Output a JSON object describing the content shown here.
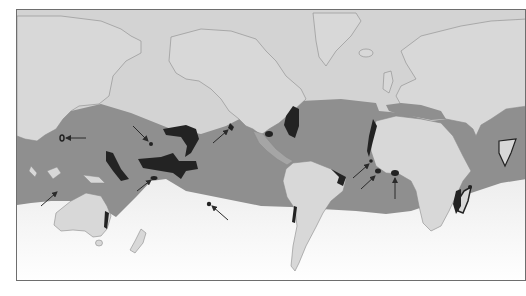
{
  "map": {
    "type": "world-distribution-map",
    "projection": "mercator-pacific-centered",
    "colors": {
      "background": "#ffffff",
      "frame_border": "#6e6e6e",
      "land": "#d6d6d6",
      "northern_ocean": "#d2d2d2",
      "range_band": "#8e8e8e",
      "southern_ocean": "#f4f4f4",
      "dense_patch": "#222222",
      "coast_outline": "#8a8a8a",
      "arrow": "#2a2a2a"
    },
    "legend": [],
    "labels": [],
    "arrows": [
      {
        "target": "western-pacific-oval",
        "from": [
          85,
          137
        ],
        "to": [
          63,
          137
        ]
      },
      {
        "target": "central-pacific-dot",
        "from": [
          132,
          125
        ],
        "to": [
          148,
          141
        ]
      },
      {
        "target": "mexico-pacific-coast",
        "from": [
          212,
          142
        ],
        "to": [
          228,
          128
        ]
      },
      {
        "target": "indonesia-patch",
        "from": [
          40,
          205
        ],
        "to": [
          57,
          190
        ]
      },
      {
        "target": "south-pacific-patch",
        "from": [
          136,
          190
        ],
        "to": [
          146,
          181
        ]
      },
      {
        "target": "south-pacific-dot-east",
        "from": [
          227,
          219
        ],
        "to": [
          210,
          205
        ]
      },
      {
        "target": "west-africa-dot-1",
        "from": [
          352,
          177
        ],
        "to": [
          368,
          164
        ]
      },
      {
        "target": "west-africa-dot-2",
        "from": [
          360,
          188
        ],
        "to": [
          375,
          175
        ]
      },
      {
        "target": "gulf-of-guinea",
        "from": [
          394,
          198
        ],
        "to": [
          394,
          178
        ]
      }
    ]
  }
}
